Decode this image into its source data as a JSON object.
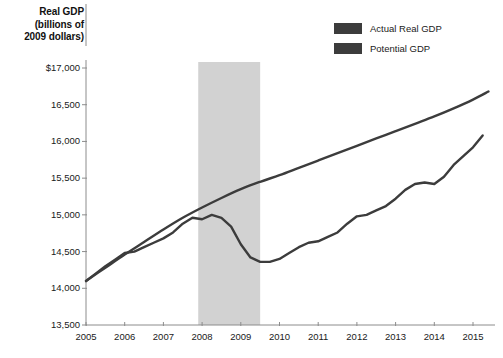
{
  "axis_title": {
    "line1": "Real GDP",
    "line2": "(billions of",
    "line3": "2009 dollars)"
  },
  "legend": {
    "items": [
      {
        "label": "Actual Real GDP",
        "color": "#3c3c3c"
      },
      {
        "label": "Potential GDP",
        "color": "#3c3c3c"
      }
    ]
  },
  "colors": {
    "actual_line": "#3c3c3c",
    "potential_line": "#3c3c3c",
    "recession_band": "#d2d2d2",
    "axis": "#8c8c8c",
    "text": "#1a1a1a"
  },
  "chart_data": {
    "type": "line",
    "title": "",
    "subtitle": "",
    "xlabel": "",
    "ylabel": "Real GDP (billions of 2009 dollars)",
    "xlim": [
      2005,
      2015.4
    ],
    "ylim": [
      13500,
      17000
    ],
    "grid": false,
    "legend_position": "top-right",
    "ytick_labels": [
      "$17,000",
      "16,500",
      "16,000",
      "15,500",
      "15,000",
      "14,500",
      "14,000",
      "13,500"
    ],
    "ytick_values": [
      17000,
      16500,
      16000,
      15500,
      15000,
      14500,
      14000,
      13500
    ],
    "xtick_labels": [
      "2005",
      "2006",
      "2007",
      "2008",
      "2009",
      "2010",
      "2011",
      "2012",
      "2013",
      "2014",
      "2015"
    ],
    "xtick_values": [
      2005,
      2006,
      2007,
      2008,
      2009,
      2010,
      2011,
      2012,
      2013,
      2014,
      2015
    ],
    "annotations": [
      {
        "type": "vertical-band",
        "label": "recession",
        "x_start": 2007.9,
        "x_end": 2009.5,
        "color": "#d2d2d2"
      }
    ],
    "series": [
      {
        "name": "Actual Real GDP",
        "color": "#3c3c3c",
        "x": [
          2005.0,
          2005.25,
          2005.5,
          2005.75,
          2006.0,
          2006.25,
          2006.5,
          2006.75,
          2007.0,
          2007.25,
          2007.5,
          2007.75,
          2008.0,
          2008.25,
          2008.5,
          2008.75,
          2009.0,
          2009.25,
          2009.5,
          2009.75,
          2010.0,
          2010.25,
          2010.5,
          2010.75,
          2011.0,
          2011.25,
          2011.5,
          2011.75,
          2012.0,
          2012.25,
          2012.5,
          2012.75,
          2013.0,
          2013.25,
          2013.5,
          2013.75,
          2014.0,
          2014.25,
          2014.5,
          2014.75,
          2015.0,
          2015.25
        ],
        "y": [
          14100,
          14200,
          14300,
          14390,
          14480,
          14500,
          14560,
          14620,
          14680,
          14760,
          14880,
          14960,
          14940,
          15000,
          14960,
          14840,
          14600,
          14420,
          14360,
          14360,
          14400,
          14480,
          14560,
          14620,
          14640,
          14700,
          14760,
          14880,
          14980,
          15000,
          15060,
          15120,
          15220,
          15340,
          15420,
          15440,
          15420,
          15520,
          15680,
          15800,
          15920,
          16080
        ],
        "end_value": 16180
      },
      {
        "name": "Potential GDP",
        "color": "#3c3c3c",
        "x": [
          2005.0,
          2005.5,
          2006.0,
          2006.5,
          2007.0,
          2007.5,
          2008.0,
          2008.5,
          2009.0,
          2009.5,
          2010.0,
          2010.5,
          2011.0,
          2011.5,
          2012.0,
          2012.5,
          2013.0,
          2013.5,
          2014.0,
          2014.5,
          2015.0,
          2015.4
        ],
        "y": [
          14100,
          14280,
          14460,
          14630,
          14800,
          14960,
          15100,
          15230,
          15350,
          15450,
          15540,
          15640,
          15740,
          15840,
          15940,
          16040,
          16140,
          16240,
          16340,
          16450,
          16570,
          16680
        ],
        "end_value": 16680
      }
    ]
  }
}
